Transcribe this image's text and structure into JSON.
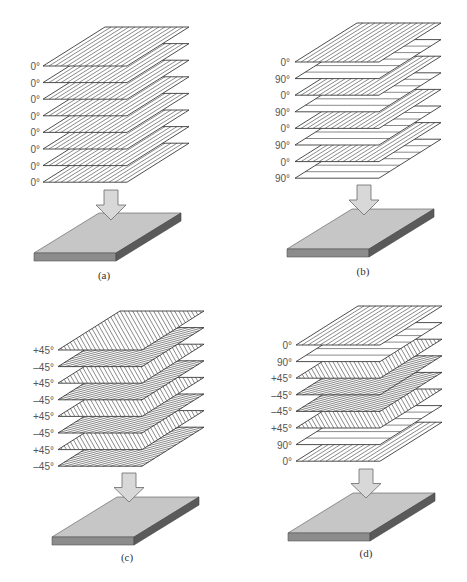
{
  "figure": {
    "panels": [
      {
        "caption": "(a)",
        "layers": [
          {
            "label": "0°",
            "angle": 0
          },
          {
            "label": "0°",
            "angle": 0
          },
          {
            "label": "0°",
            "angle": 0
          },
          {
            "label": "0°",
            "angle": 0
          },
          {
            "label": "0°",
            "angle": 0
          },
          {
            "label": "0°",
            "angle": 0
          },
          {
            "label": "0°",
            "angle": 0
          },
          {
            "label": "0°",
            "angle": 0
          }
        ]
      },
      {
        "caption": "(b)",
        "layers": [
          {
            "label": "0°",
            "angle": 0
          },
          {
            "label": "90°",
            "angle": 90
          },
          {
            "label": "0°",
            "angle": 0
          },
          {
            "label": "90°",
            "angle": 90
          },
          {
            "label": "0°",
            "angle": 0
          },
          {
            "label": "90°",
            "angle": 90
          },
          {
            "label": "0°",
            "angle": 0
          },
          {
            "label": "90°",
            "angle": 90
          }
        ]
      },
      {
        "caption": "(c)",
        "layers": [
          {
            "label": "+45°",
            "angle": 45
          },
          {
            "label": "–45°",
            "angle": -45
          },
          {
            "label": "+45°",
            "angle": 45
          },
          {
            "label": "–45°",
            "angle": -45
          },
          {
            "label": "+45°",
            "angle": 45
          },
          {
            "label": "–45°",
            "angle": -45
          },
          {
            "label": "+45°",
            "angle": 45
          },
          {
            "label": "–45°",
            "angle": -45
          }
        ]
      },
      {
        "caption": "(d)",
        "layers": [
          {
            "label": "0°",
            "angle": 0
          },
          {
            "label": "90°",
            "angle": 90
          },
          {
            "label": "+45°",
            "angle": 45
          },
          {
            "label": "–45°",
            "angle": -45
          },
          {
            "label": "–45°",
            "angle": -45
          },
          {
            "label": "+45°",
            "angle": 45
          },
          {
            "label": "90°",
            "angle": 90
          },
          {
            "label": "0°",
            "angle": 0
          }
        ]
      }
    ],
    "colors": {
      "plate_top": "#c6c6c6",
      "plate_front": "#8c8c8c",
      "plate_side": "#5a5a5a",
      "arrow": "#d8d8d8"
    }
  }
}
